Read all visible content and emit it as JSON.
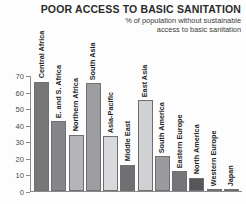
{
  "chart_data": {
    "type": "bar",
    "title": "POOR ACCESS TO BASIC SANITATION",
    "subtitle_line1": "% of population without sustainable",
    "subtitle_line2": "access to basic sanitation",
    "xlabel": "",
    "ylabel": "",
    "ylim": [
      0,
      70
    ],
    "ytick_step": 10,
    "yticks": [
      70,
      60,
      50,
      40,
      30,
      20,
      10,
      0
    ],
    "ytick_labels": [
      "70",
      "60",
      "50",
      "40",
      "30",
      "20",
      "10",
      "0"
    ],
    "grid": false,
    "legend": "none",
    "categories": [
      "Central Africa",
      "E. and S. Africa",
      "Northern Africa",
      "South Asia",
      "Asia-Pacific",
      "Middle East",
      "East Asia",
      "South America",
      "Eastern Europe",
      "North America",
      "Western Europe",
      "Japan"
    ],
    "values": [
      66,
      42,
      34,
      65,
      33,
      16,
      55,
      21,
      12,
      8,
      1,
      1
    ],
    "bar_colors": [
      "#77777a",
      "#85868a",
      "#b3b4b7",
      "#9d9ea1",
      "#d8d9da",
      "#6f7073",
      "#d0d1d3",
      "#9a9b9e",
      "#75767a",
      "#56575a",
      "#6f7073",
      "#6f7073"
    ]
  }
}
